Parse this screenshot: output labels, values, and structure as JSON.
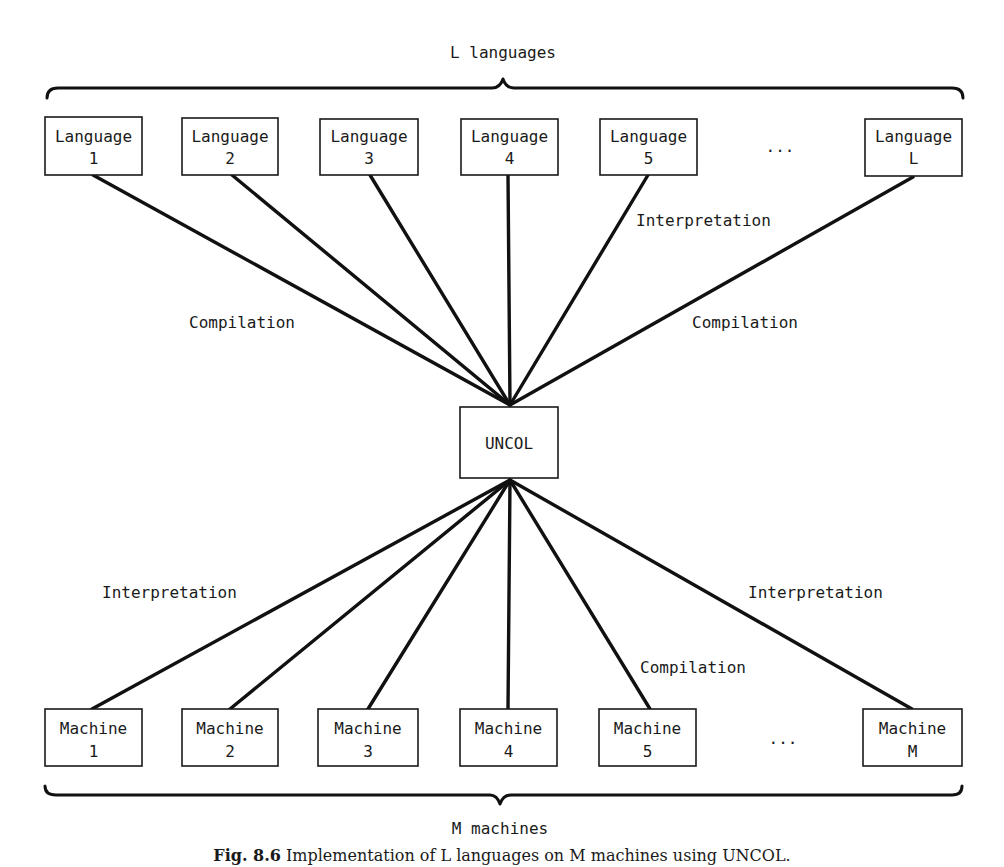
{
  "diagram": {
    "top_group_label": "L languages",
    "bottom_group_label": "M machines",
    "center_node": {
      "label": "UNCOL"
    },
    "ellipsis": "...",
    "languages": [
      {
        "line1": "Language",
        "line2": "1"
      },
      {
        "line1": "Language",
        "line2": "2"
      },
      {
        "line1": "Language",
        "line2": "3"
      },
      {
        "line1": "Language",
        "line2": "4"
      },
      {
        "line1": "Language",
        "line2": "5"
      },
      {
        "line1": "Language",
        "line2": "L"
      }
    ],
    "machines": [
      {
        "line1": "Machine",
        "line2": "1"
      },
      {
        "line1": "Machine",
        "line2": "2"
      },
      {
        "line1": "Machine",
        "line2": "3"
      },
      {
        "line1": "Machine",
        "line2": "4"
      },
      {
        "line1": "Machine",
        "line2": "5"
      },
      {
        "line1": "Machine",
        "line2": "M"
      }
    ],
    "edge_labels": {
      "upper_left": "Compilation",
      "upper_mid_right": "Interpretation",
      "upper_right": "Compilation",
      "lower_left": "Interpretation",
      "lower_mid_right": "Compilation",
      "lower_right": "Interpretation"
    },
    "line_color": "#111111"
  },
  "caption": {
    "fig_label": "Fig. 8.6",
    "text": "Implementation of L languages on M machines using UNCOL."
  }
}
